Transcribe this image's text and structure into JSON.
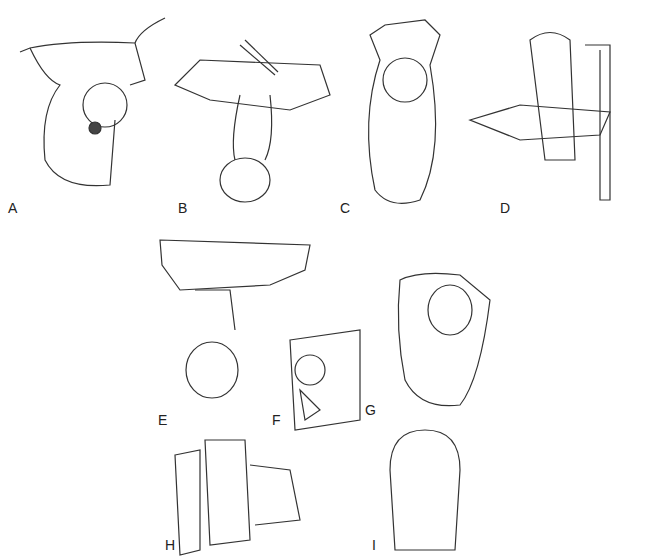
{
  "figure": {
    "panels": [
      {
        "label": "A",
        "x": 8,
        "y": 208
      },
      {
        "label": "B",
        "x": 178,
        "y": 208
      },
      {
        "label": "C",
        "x": 340,
        "y": 208
      },
      {
        "label": "D",
        "x": 500,
        "y": 208
      },
      {
        "label": "E",
        "x": 158,
        "y": 420
      },
      {
        "label": "F",
        "x": 272,
        "y": 420
      },
      {
        "label": "G",
        "x": 365,
        "y": 410
      },
      {
        "label": "H",
        "x": 165,
        "y": 545
      },
      {
        "label": "I",
        "x": 372,
        "y": 545
      }
    ]
  }
}
